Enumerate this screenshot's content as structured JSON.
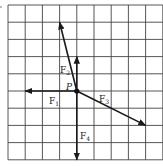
{
  "diagram": {
    "grid": {
      "origin_x": 8,
      "origin_y": 5,
      "cell": 17.2,
      "cols": 9,
      "rows": 9,
      "line_color": "#333333"
    },
    "point": {
      "label": "P",
      "col": 4,
      "row": 5
    },
    "vectors": [
      {
        "id": "F1",
        "label": "F",
        "sub": "1",
        "dx": -3,
        "dy": 0,
        "label_x": 49,
        "label_y": 104
      },
      {
        "id": "F2",
        "label": "F",
        "sub": "2",
        "dx": -1,
        "dy": -4,
        "label_x": 60,
        "label_y": 73
      },
      {
        "id": "F2v",
        "label": "",
        "sub": "",
        "dx": 0,
        "dy": -2,
        "label_x": 0,
        "label_y": 0
      },
      {
        "id": "F3",
        "label": "F",
        "sub": "3",
        "dx": 4,
        "dy": 2,
        "label_x": 99,
        "label_y": 102
      },
      {
        "id": "F4",
        "label": "F",
        "sub": "4",
        "dx": 0,
        "dy": 4,
        "label_x": 80,
        "label_y": 139
      }
    ],
    "labels": {
      "p": "P",
      "f1": "F",
      "f1_sub": "1",
      "f2": "F",
      "f2_sub": "2",
      "f3": "F",
      "f3_sub": "3",
      "f4": "F",
      "f4_sub": "4"
    },
    "stroke_color": "#1a1a1a"
  }
}
